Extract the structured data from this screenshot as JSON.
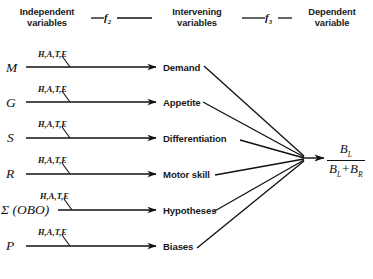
{
  "figure": {
    "background": "#ffffff",
    "ink": "#111111"
  },
  "headers": {
    "independent": "Independent\nvariables",
    "intervening": "Intervening\nvariables",
    "dependent": "Dependent\nvariable"
  },
  "function_labels": {
    "f1": {
      "base": "f",
      "sub": "2"
    },
    "f2": {
      "base": "f",
      "sub": "3"
    }
  },
  "modifier_label": "H,A,T,E",
  "rows": [
    {
      "independent": "M",
      "intervening": "Demand",
      "modifier": "H,A,T,E"
    },
    {
      "independent": "G",
      "intervening": "Appetite",
      "modifier": "H,A,T,E"
    },
    {
      "independent": "S",
      "intervening": "Differentiation",
      "modifier": "H,A,T,E"
    },
    {
      "independent": "R",
      "intervening": "Motor skill",
      "modifier": "H,A,T,E"
    },
    {
      "independent": "Σ (OBO)",
      "intervening": "Hypotheses",
      "modifier": "H,A,T,E"
    },
    {
      "independent": "P",
      "intervening": "Biases",
      "modifier": "H,A,T,E"
    }
  ],
  "dependent_variable": {
    "numerator": {
      "base": "B",
      "sub": "L"
    },
    "denominator_left": {
      "base": "B",
      "sub": "L"
    },
    "denominator_op": "+",
    "denominator_right": {
      "base": "B",
      "sub": "R"
    },
    "plain": "B_L / (B_L + B_R)"
  }
}
